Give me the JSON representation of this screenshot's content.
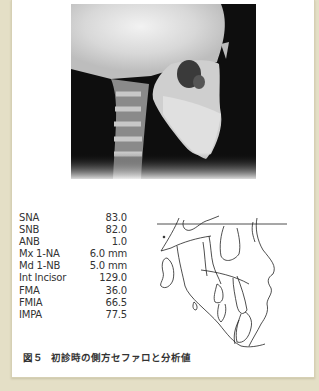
{
  "figure": {
    "number": "図５",
    "caption": "初診時の側方セファロと分析値",
    "image": {
      "type": "lateral-cephalometric-radiograph",
      "description": "Lateral cephalometric X-ray of skull, profile facing right"
    },
    "tracing": {
      "type": "cephalometric-tracing",
      "description": "Line tracing of lateral ceph with horizontal reference line"
    },
    "measurements": [
      {
        "label": "SNA",
        "value": "83.0"
      },
      {
        "label": "SNB",
        "value": "82.0"
      },
      {
        "label": "ANB",
        "value": "1.0"
      },
      {
        "label": "Mx 1-NA",
        "value": "6.0 mm"
      },
      {
        "label": "Md 1-NB",
        "value": "5.0 mm"
      },
      {
        "label": "Int Incisor",
        "value": "129.0"
      },
      {
        "label": "FMA",
        "value": "36.0"
      },
      {
        "label": "FMIA",
        "value": "66.5"
      },
      {
        "label": "IMPA",
        "value": "77.5"
      }
    ]
  },
  "colors": {
    "page_background": "#e4dfc6",
    "card_background": "#ffffff",
    "text": "#333333"
  }
}
